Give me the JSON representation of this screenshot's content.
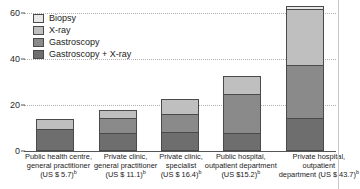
{
  "chart_data": {
    "type": "bar",
    "stacked": true,
    "title": "",
    "xlabel": "",
    "ylabel": "",
    "ylim": [
      0,
      62
    ],
    "yticks": [
      0,
      20,
      40,
      60
    ],
    "ytick_labels": [
      "0",
      "20",
      "40",
      "60"
    ],
    "grid": true,
    "grid_style": "dotted horizontal",
    "legend_position": "top-left inside",
    "categories": [
      "Public health centre, general practitioner (US $ 5.7)",
      "Private clinic, general practitioner (US $ 11.1)",
      "Private clinic, specialist (US $ 16.4)",
      "Public hospital, outpatient department (US $15.2)",
      "Private hospital, outpatient department (US $ 43.7)"
    ],
    "series": [
      {
        "name": "Gastroscopy + X-ray",
        "color": "#6e6e6e",
        "values": [
          8.5,
          7.0,
          7.5,
          7.0,
          13.5
        ]
      },
      {
        "name": "Gastroscopy",
        "color": "#8a8a8a",
        "values": [
          0.0,
          6.5,
          7.5,
          17.0,
          23.0
        ]
      },
      {
        "name": "X-ray",
        "color": "#bfbfbf",
        "values": [
          4.5,
          3.5,
          6.5,
          7.5,
          24.0
        ]
      },
      {
        "name": "Biopsy",
        "color": "#e8e8e8",
        "values": [
          0.0,
          0.0,
          0.0,
          0.0,
          1.5
        ]
      }
    ],
    "totals": [
      13.0,
      17.0,
      21.5,
      31.5,
      62.0
    ]
  },
  "legend": {
    "items": [
      {
        "label": "Biopsy",
        "color": "#e8e8e8"
      },
      {
        "label": "X-ray",
        "color": "#bfbfbf"
      },
      {
        "label": "Gastroscopy",
        "color": "#8a8a8a"
      },
      {
        "label": "Gastroscopy + X-ray",
        "color": "#6e6e6e"
      }
    ]
  },
  "yaxis": {
    "ticks": [
      {
        "value": 60,
        "label": "60"
      },
      {
        "value": 40,
        "label": "40"
      },
      {
        "value": 20,
        "label": "20"
      },
      {
        "value": 0,
        "label": "0"
      }
    ]
  },
  "xaxis": {
    "labels": [
      {
        "line1": "Public health centre,",
        "line2": "general practitioner",
        "line3": "(US $ 5.7)",
        "note": "b"
      },
      {
        "line1": "Private clinic,",
        "line2": "general practitioner",
        "line3": "(US $ 11.1)",
        "note": "b"
      },
      {
        "line1": "Private clinic,",
        "line2": "specialist",
        "line3": "(US $ 16.4)",
        "note": "b"
      },
      {
        "line1": "Public hospital,",
        "line2": "outpatient department",
        "line3": "(US $15.2)",
        "note": "b"
      },
      {
        "line1": "Private hospital,",
        "line2": "outpatient",
        "line3": "department (US $ 43.7)",
        "note": "b"
      }
    ]
  },
  "colors": {
    "axis": "#555555",
    "grid": "#b0b0b0",
    "text": "#1a1a1a",
    "background": "#ffffff"
  }
}
